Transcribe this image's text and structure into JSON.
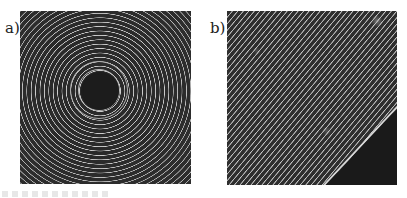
{
  "figure": {
    "panels": [
      {
        "label": "a)",
        "description": "concentric circular fringe pattern with dark center"
      },
      {
        "label": "b)",
        "description": "diagonal straight fringe pattern with dark triangular corner at bottom-right"
      }
    ],
    "colors": {
      "fringe_dark": "#2a2a2a",
      "fringe_light": "#c8c8c8",
      "background": "#ffffff"
    }
  }
}
